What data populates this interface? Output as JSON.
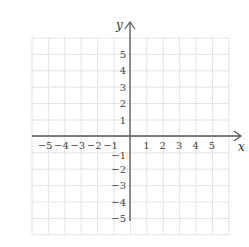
{
  "diagram": {
    "type": "coordinate-plane",
    "x_axis": {
      "label": "x",
      "min": -6,
      "max": 6,
      "ticks": [
        -5,
        -4,
        -3,
        -2,
        -1,
        1,
        2,
        3,
        4,
        5
      ]
    },
    "y_axis": {
      "label": "y",
      "min": -6,
      "max": 6,
      "ticks": [
        5,
        4,
        3,
        2,
        1,
        -1,
        -2,
        -3,
        -4,
        -5
      ]
    },
    "x_tick_labels": [
      "−5",
      "−4",
      "−3",
      "−2",
      "−1",
      "1",
      "2",
      "3",
      "4",
      "5"
    ],
    "y_tick_labels": [
      "5",
      "4",
      "3",
      "2",
      "1",
      "−1",
      "−2",
      "−3",
      "−4",
      "−5"
    ],
    "grid": {
      "rows": 12,
      "cols": 12,
      "style": "dotted",
      "color": "#c8c8c8"
    },
    "axis_color": "#555555"
  }
}
